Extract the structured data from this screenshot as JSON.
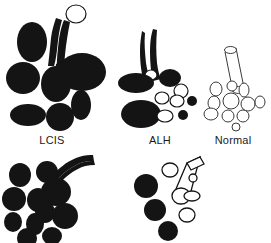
{
  "figure": {
    "background_color": "#ffffff",
    "fill_color": "#141414",
    "open_color": "#ffffff",
    "outline_color": "#141414",
    "width": 271,
    "height": 243
  },
  "labels": {
    "lcis": "LCIS",
    "alh": "ALH",
    "normal": "Normal"
  },
  "panels": [
    {
      "id": "lcis-top",
      "label": "LCIS",
      "label_x": 52,
      "label_y": 140,
      "description": "Terminal duct lobular unit with all lobules completely filled (solid black), duct partly expanded with one open rounded terminus",
      "duct": {
        "style": "dark",
        "terminus": "open-circle",
        "terminus_cx": 76,
        "terminus_cy": 14,
        "terminus_rx": 10,
        "terminus_ry": 9
      },
      "lobules": [
        {
          "cx": 32,
          "cy": 42,
          "rx": 15,
          "ry": 20,
          "state": "filled"
        },
        {
          "cx": 82,
          "cy": 72,
          "rx": 24,
          "ry": 19,
          "state": "filled"
        },
        {
          "cx": 23,
          "cy": 78,
          "rx": 17,
          "ry": 16,
          "state": "filled"
        },
        {
          "cx": 56,
          "cy": 84,
          "rx": 15,
          "ry": 18,
          "state": "filled"
        },
        {
          "cx": 28,
          "cy": 115,
          "rx": 18,
          "ry": 11,
          "state": "filled"
        },
        {
          "cx": 60,
          "cy": 117,
          "rx": 14,
          "ry": 14,
          "state": "filled"
        },
        {
          "cx": 81,
          "cy": 105,
          "rx": 10,
          "ry": 15,
          "state": "filled"
        }
      ]
    },
    {
      "id": "alh-top",
      "label": "ALH",
      "label_x": 159,
      "label_y": 140,
      "description": "Partly filled lobules: large solid lobules mixed with small open acini and a few small filled acini; duct dark with small open circle at base",
      "duct": {
        "style": "dark",
        "terminus": "open-circle",
        "terminus_cx": 151,
        "terminus_cy": 75,
        "terminus_rx": 6,
        "terminus_ry": 5
      },
      "lobules": [
        {
          "cx": 136,
          "cy": 83,
          "rx": 18,
          "ry": 10,
          "state": "filled"
        },
        {
          "cx": 170,
          "cy": 78,
          "rx": 11,
          "ry": 9,
          "state": "filled"
        },
        {
          "cx": 141,
          "cy": 114,
          "rx": 20,
          "ry": 14,
          "state": "filled"
        },
        {
          "cx": 181,
          "cy": 91,
          "rx": 7,
          "ry": 7,
          "state": "open"
        },
        {
          "cx": 162,
          "cy": 98,
          "rx": 7,
          "ry": 6,
          "state": "open"
        },
        {
          "cx": 177,
          "cy": 101,
          "rx": 7,
          "ry": 6,
          "state": "open"
        },
        {
          "cx": 165,
          "cy": 116,
          "rx": 8,
          "ry": 6,
          "state": "open"
        },
        {
          "cx": 192,
          "cy": 101,
          "rx": 5,
          "ry": 5,
          "state": "filled"
        },
        {
          "cx": 183,
          "cy": 115,
          "rx": 5,
          "ry": 5,
          "state": "filled"
        }
      ]
    },
    {
      "id": "normal-top",
      "label": "Normal",
      "label_x": 232,
      "label_y": 140,
      "description": "Normal terminal duct lobular unit: open tubular duct and all acini open (unfilled outlines)",
      "duct": {
        "style": "open-tube",
        "terminus": "open-ellipse"
      },
      "lobules": [
        {
          "cx": 216,
          "cy": 89,
          "rx": 6,
          "ry": 7,
          "state": "open"
        },
        {
          "cx": 232,
          "cy": 86,
          "rx": 5,
          "ry": 5,
          "state": "open"
        },
        {
          "cx": 244,
          "cy": 90,
          "rx": 5,
          "ry": 7,
          "state": "open"
        },
        {
          "cx": 214,
          "cy": 103,
          "rx": 6,
          "ry": 7,
          "state": "open"
        },
        {
          "cx": 231,
          "cy": 101,
          "rx": 8,
          "ry": 8,
          "state": "open"
        },
        {
          "cx": 248,
          "cy": 104,
          "rx": 7,
          "ry": 7,
          "state": "open"
        },
        {
          "cx": 260,
          "cy": 102,
          "rx": 5,
          "ry": 6,
          "state": "open"
        },
        {
          "cx": 211,
          "cy": 114,
          "rx": 7,
          "ry": 6,
          "state": "open"
        },
        {
          "cx": 228,
          "cy": 116,
          "rx": 6,
          "ry": 6,
          "state": "open"
        },
        {
          "cx": 243,
          "cy": 116,
          "rx": 6,
          "ry": 6,
          "state": "open"
        },
        {
          "cx": 236,
          "cy": 127,
          "rx": 4,
          "ry": 4,
          "state": "open"
        }
      ]
    },
    {
      "id": "lcis-bottom",
      "label": "",
      "description": "Extensive LCIS: numerous completely filled lobules, dark duct with thin white lumen highlight",
      "duct": {
        "style": "dark-highlight",
        "terminus": "none"
      },
      "lobules": [
        {
          "cx": 20,
          "cy": 175,
          "rx": 11,
          "ry": 12,
          "state": "filled"
        },
        {
          "cx": 47,
          "cy": 172,
          "rx": 11,
          "ry": 11,
          "state": "filled"
        },
        {
          "cx": 56,
          "cy": 192,
          "rx": 15,
          "ry": 14,
          "state": "filled"
        },
        {
          "cx": 14,
          "cy": 199,
          "rx": 12,
          "ry": 12,
          "state": "filled"
        },
        {
          "cx": 38,
          "cy": 200,
          "rx": 11,
          "ry": 12,
          "state": "filled"
        },
        {
          "cx": 13,
          "cy": 222,
          "rx": 9,
          "ry": 10,
          "state": "filled"
        },
        {
          "cx": 35,
          "cy": 224,
          "rx": 9,
          "ry": 11,
          "state": "filled"
        },
        {
          "cx": 45,
          "cy": 212,
          "rx": 10,
          "ry": 11,
          "state": "filled"
        },
        {
          "cx": 65,
          "cy": 216,
          "rx": 13,
          "ry": 13,
          "state": "filled"
        },
        {
          "cx": 27,
          "cy": 238,
          "rx": 10,
          "ry": 10,
          "state": "filled"
        },
        {
          "cx": 52,
          "cy": 236,
          "rx": 10,
          "ry": 9,
          "state": "filled"
        }
      ]
    },
    {
      "id": "alh-bottom",
      "label": "",
      "description": "ALH variant: open tubular duct with mixture of open and partially filled acini",
      "duct": {
        "style": "open-tube",
        "terminus": "open-ellipse"
      },
      "lobules": [
        {
          "cx": 170,
          "cy": 170,
          "rx": 8,
          "ry": 7,
          "state": "open"
        },
        {
          "cx": 171,
          "cy": 189,
          "rx": 9,
          "ry": 8,
          "state": "open"
        },
        {
          "cx": 193,
          "cy": 178,
          "rx": 4,
          "ry": 4,
          "state": "open"
        },
        {
          "cx": 192,
          "cy": 196,
          "rx": 8,
          "ry": 5,
          "state": "open"
        },
        {
          "cx": 187,
          "cy": 215,
          "rx": 8,
          "ry": 7,
          "state": "open"
        },
        {
          "cx": 146,
          "cy": 186,
          "rx": 12,
          "ry": 12,
          "state": "filled"
        },
        {
          "cx": 155,
          "cy": 210,
          "rx": 11,
          "ry": 11,
          "state": "filled"
        },
        {
          "cx": 168,
          "cy": 231,
          "rx": 10,
          "ry": 10,
          "state": "filled"
        }
      ]
    }
  ]
}
